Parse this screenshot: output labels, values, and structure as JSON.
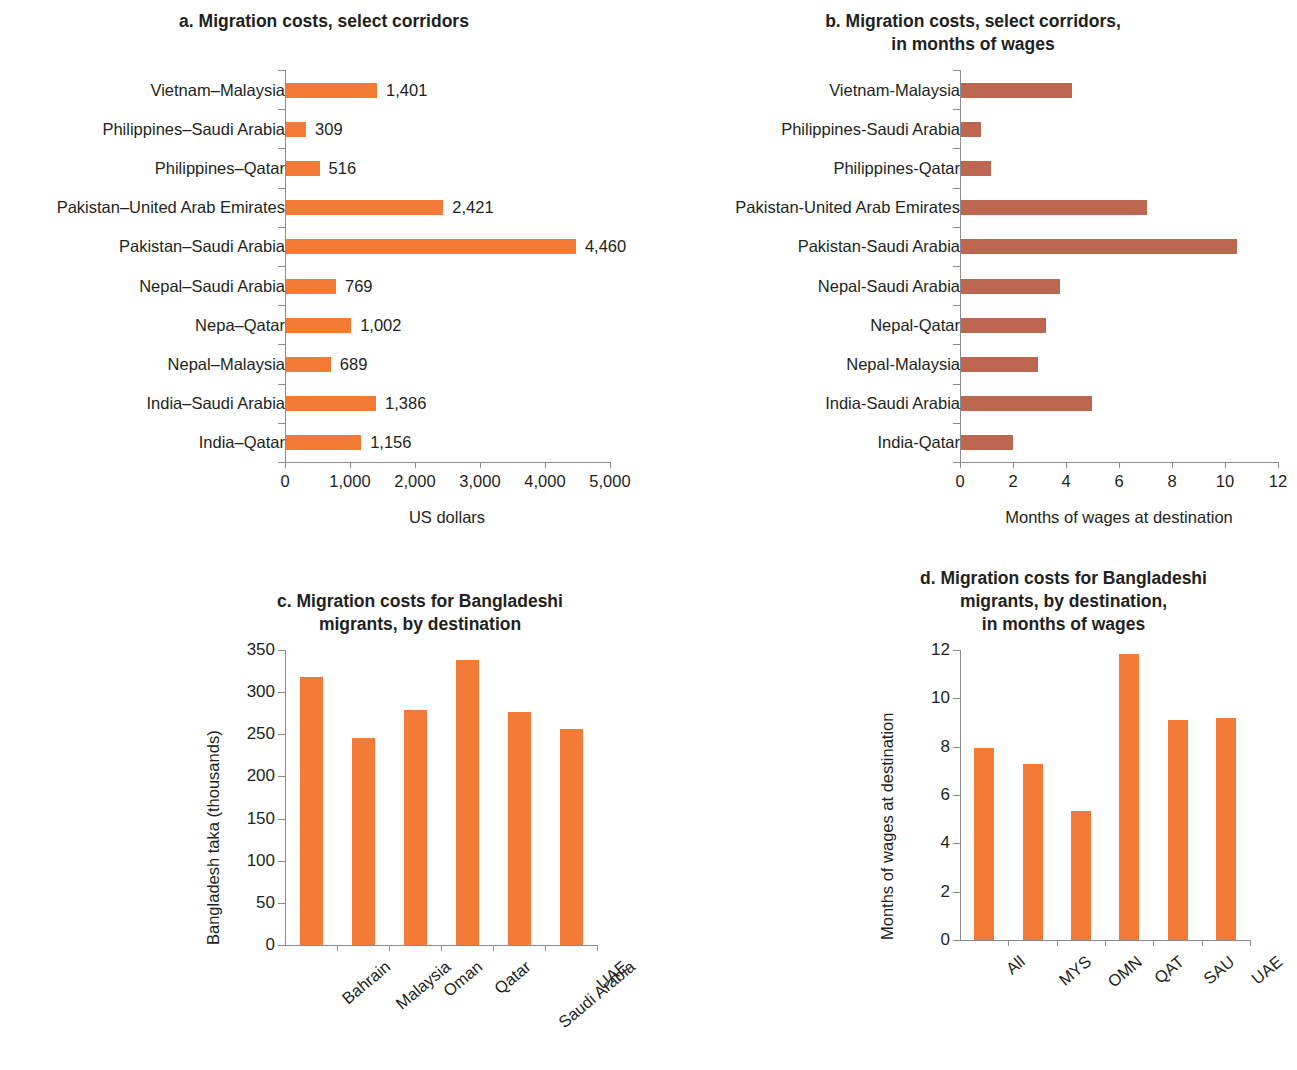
{
  "figure": {
    "colors": {
      "orange": "#f47b35",
      "brown_red": "#bd6650",
      "axis": "#8c8c8c",
      "text": "#231f20"
    }
  },
  "chart_data": [
    {
      "id": "panel-a",
      "type": "bar",
      "orientation": "horizontal",
      "title": "a. Migration costs, select corridors",
      "xlabel": "US dollars",
      "ylabel": "",
      "xlim": [
        0,
        5000
      ],
      "xticks": [
        0,
        1000,
        2000,
        3000,
        4000,
        5000
      ],
      "xticklabels": [
        "0",
        "1,000",
        "2,000",
        "3,000",
        "4,000",
        "5,000"
      ],
      "grid": false,
      "legend": "none",
      "color": "#f47b35",
      "data_labels": true,
      "categories": [
        "Vietnam–Malaysia",
        "Philippines–Saudi Arabia",
        "Philippines–Qatar",
        "Pakistan–United Arab Emirates",
        "Pakistan–Saudi Arabia",
        "Nepal–Saudi Arabia",
        "Nepa–Qatar",
        "Nepal–Malaysia",
        "India–Saudi Arabia",
        "India–Qatar"
      ],
      "values": [
        1401,
        309,
        516,
        2421,
        4460,
        769,
        1002,
        689,
        1386,
        1156
      ],
      "value_labels": [
        "1,401",
        "309",
        "516",
        "2,421",
        "4,460",
        "769",
        "1,002",
        "689",
        "1,386",
        "1,156"
      ]
    },
    {
      "id": "panel-b",
      "type": "bar",
      "orientation": "horizontal",
      "title": "b. Migration costs, select corridors,\nin months of wages",
      "title_lines": [
        "b. Migration costs, select corridors,",
        "in months of wages"
      ],
      "xlabel": "Months of wages at destination",
      "ylabel": "",
      "xlim": [
        0,
        12
      ],
      "xticks": [
        0,
        2,
        4,
        6,
        8,
        10,
        12
      ],
      "xticklabels": [
        "0",
        "2",
        "4",
        "6",
        "8",
        "10",
        "12"
      ],
      "grid": false,
      "legend": "none",
      "color": "#bd6650",
      "data_labels": false,
      "categories": [
        "Vietnam-Malaysia",
        "Philippines-Saudi Arabia",
        "Philippines-Qatar",
        "Pakistan-United Arab Emirates",
        "Pakistan-Saudi Arabia",
        "Nepal-Saudi Arabia",
        "Nepal-Qatar",
        "Nepal-Malaysia",
        "India-Saudi Arabia",
        "India-Qatar"
      ],
      "values": [
        4.2,
        0.75,
        1.15,
        7.0,
        10.4,
        3.75,
        3.2,
        2.9,
        4.95,
        1.95
      ]
    },
    {
      "id": "panel-c",
      "type": "bar",
      "orientation": "vertical",
      "title": "c. Migration costs for Bangladeshi\nmigrants, by destination",
      "title_lines": [
        "c. Migration costs for Bangladeshi",
        "migrants, by destination"
      ],
      "xlabel": "",
      "ylabel": "Bangladesh taka (thousands)",
      "ylim": [
        0,
        350
      ],
      "yticks": [
        0,
        50,
        100,
        150,
        200,
        250,
        300,
        350
      ],
      "yticklabels": [
        "0",
        "50",
        "100",
        "150",
        "200",
        "250",
        "300",
        "350"
      ],
      "grid": false,
      "legend": "none",
      "color": "#f47b35",
      "categories": [
        "Bahrain",
        "Malaysia",
        "Oman",
        "Qatar",
        "Saudi Arabia",
        "UAE"
      ],
      "values": [
        318,
        246,
        279,
        338,
        276,
        256
      ]
    },
    {
      "id": "panel-d",
      "type": "bar",
      "orientation": "vertical",
      "title": "d. Migration costs for Bangladeshi\nmigrants, by destination,\nin months of wages",
      "title_lines": [
        "d. Migration costs for Bangladeshi",
        "migrants, by destination,",
        "in months of wages"
      ],
      "xlabel": "",
      "ylabel": "Months of wages at destination",
      "ylim": [
        0,
        12
      ],
      "yticks": [
        0,
        2,
        4,
        6,
        8,
        10,
        12
      ],
      "yticklabels": [
        "0",
        "2",
        "4",
        "6",
        "8",
        "10",
        "12"
      ],
      "grid": false,
      "legend": "none",
      "color": "#f47b35",
      "categories": [
        "All",
        "MYS",
        "OMN",
        "QAT",
        "SAU",
        "UAE"
      ],
      "values": [
        7.95,
        7.3,
        5.35,
        11.85,
        9.1,
        9.2
      ]
    }
  ]
}
